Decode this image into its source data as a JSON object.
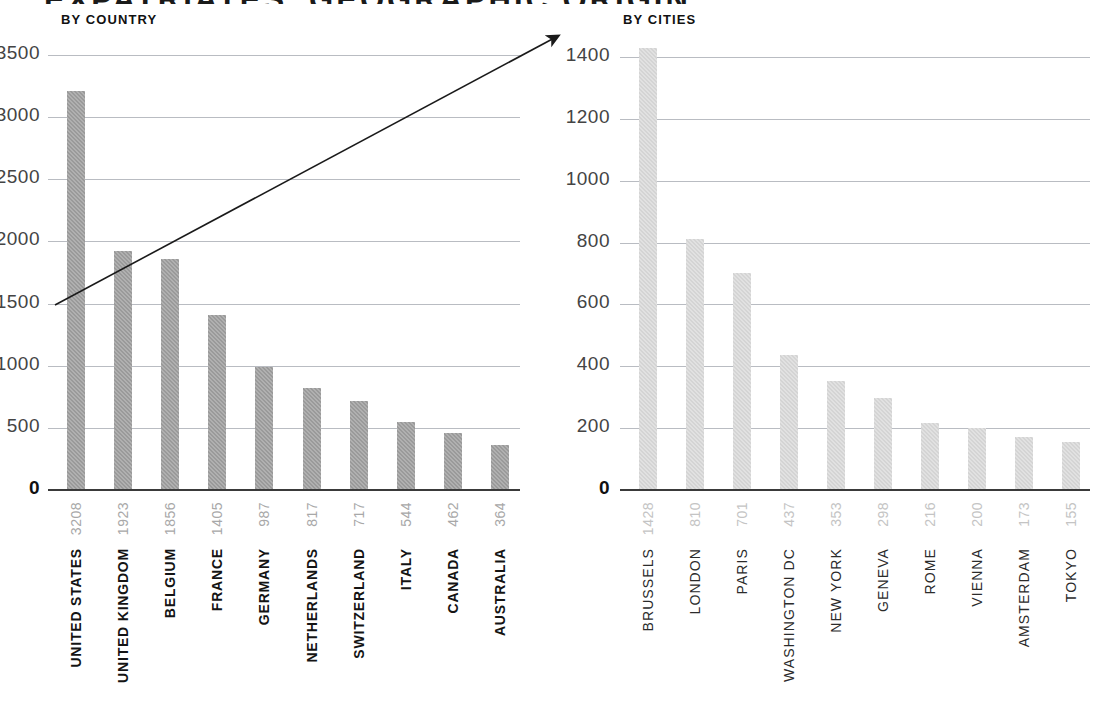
{
  "title": "EXPATRIATES' GEOGRAPHIC ORIGIN",
  "panels": {
    "country": {
      "subtitle": "BY COUNTRY",
      "axis_ticks": [
        "3500",
        "3000",
        "2500",
        "2000",
        "1500",
        "1000",
        "500",
        "0"
      ]
    },
    "cities": {
      "subtitle": "BY CITIES",
      "axis_ticks": [
        "1400",
        "1200",
        "1000",
        "800",
        "600",
        "400",
        "200",
        "0"
      ]
    }
  },
  "colors": {
    "country_bar": "#9a9a9a",
    "cities_bar": "#d4d4d4",
    "gridline": "#b9bcc2",
    "axis": "#3a3a3a",
    "value_label": "#a8a8a8",
    "arrow": "#1a1a1a"
  },
  "annotations": {
    "trend_arrow": {
      "name": "upward-trend-arrow",
      "from": [
        55,
        305
      ],
      "to": [
        566,
        31
      ]
    }
  },
  "chart_data": [
    {
      "type": "bar",
      "title": "BY COUNTRY",
      "xlabel": "",
      "ylabel": "",
      "ylim": [
        0,
        3500
      ],
      "ytick_step": 500,
      "grid": true,
      "legend": "none",
      "orientation": "vertical",
      "categories": [
        "UNITED STATES",
        "UNITED KINGDOM",
        "BELGIUM",
        "FRANCE",
        "GERMANY",
        "NETHERLANDS",
        "SWITZERLAND",
        "ITALY",
        "CANADA",
        "AUSTRALIA"
      ],
      "values": [
        3208,
        1923,
        1856,
        1405,
        987,
        817,
        717,
        544,
        462,
        364
      ]
    },
    {
      "type": "bar",
      "title": "BY CITIES",
      "xlabel": "",
      "ylabel": "",
      "ylim": [
        0,
        1400
      ],
      "ytick_step": 200,
      "grid": true,
      "legend": "none",
      "orientation": "vertical",
      "categories": [
        "BRUSSELS",
        "LONDON",
        "PARIS",
        "WASHINGTON DC",
        "NEW YORK",
        "GENEVA",
        "ROME",
        "VIENNA",
        "AMSTERDAM",
        "TOKYO"
      ],
      "values": [
        1428,
        810,
        701,
        437,
        353,
        298,
        216,
        200,
        173,
        155
      ]
    }
  ]
}
